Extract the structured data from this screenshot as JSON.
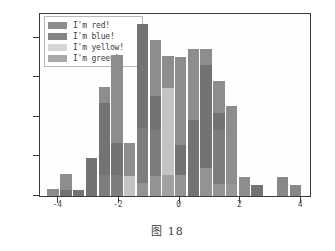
{
  "caption": "图 18",
  "legend": {
    "position": "upper-left",
    "entries": [
      {
        "label": "I'm red!",
        "color": "#8d8d8d"
      },
      {
        "label": "I'm blue!",
        "color": "#6e6e6e"
      },
      {
        "label": "I'm yellow!",
        "color": "#cfcfcf"
      },
      {
        "label": "I'm green!",
        "color": "#9a9a9a"
      }
    ]
  },
  "chart_data": {
    "type": "bar",
    "title": "",
    "xlabel": "",
    "ylabel": "",
    "xlim": [
      -4.6,
      4.3
    ],
    "ylim": [
      0,
      23
    ],
    "grid": false,
    "legend_position": "upper left",
    "xticks": [
      -4,
      -2,
      0,
      2,
      4
    ],
    "yticks": [
      0,
      5,
      10,
      15,
      20
    ],
    "bin_width": 0.42,
    "series": [
      {
        "name": "I'm red!",
        "color": "#8d8d8d",
        "x": [
          -4.15,
          -3.72,
          -3.3,
          -2.88,
          -2.46,
          -2.04,
          -1.62,
          -1.2,
          -0.78,
          -0.36,
          0.06,
          0.48,
          0.9,
          1.32,
          1.74,
          2.16,
          2.58,
          3.0,
          3.42,
          3.84
        ],
        "values": [
          0.9,
          2.8,
          0.8,
          4.8,
          13.8,
          17.8,
          6.7,
          21.7,
          19.7,
          17.7,
          17.6,
          18.6,
          18.6,
          14.5,
          11.4,
          2.4,
          1.4,
          0,
          0,
          0
        ]
      },
      {
        "name": "I'm blue!",
        "color": "#6e6e6e",
        "x": [
          -4.15,
          -3.72,
          -3.3,
          -2.88,
          -2.46,
          -2.04,
          -1.62,
          -1.2,
          -0.78,
          -0.36,
          0.06,
          0.48,
          0.9,
          1.32,
          1.74,
          2.16,
          2.58,
          3.0,
          3.42,
          3.84
        ],
        "values": [
          0,
          0.8,
          0.8,
          4.8,
          11.7,
          6.7,
          0,
          21.7,
          12.7,
          0,
          6.5,
          9.6,
          16.6,
          10.5,
          0,
          0,
          1.4,
          0,
          2.4,
          1.4
        ]
      },
      {
        "name": "I'm yellow!",
        "color": "#cfcfcf",
        "x": [
          -4.15,
          -3.72,
          -3.3,
          -2.88,
          -2.46,
          -2.04,
          -1.62,
          -1.2,
          -0.78,
          -0.36,
          0.06,
          0.48,
          0.9,
          1.32,
          1.74,
          2.16,
          2.58,
          3.0,
          3.42,
          3.84
        ],
        "values": [
          0,
          0,
          0,
          0,
          2.7,
          2.7,
          2.5,
          8.6,
          8.4,
          13.6,
          0,
          0,
          0,
          8.3,
          0,
          0,
          0,
          0,
          0,
          0
        ]
      },
      {
        "name": "I'm green!",
        "color": "#9a9a9a",
        "x": [
          -4.15,
          -3.72,
          -3.3,
          -2.88,
          -2.46,
          -2.04,
          -1.62,
          -1.2,
          -0.78,
          -0.36,
          0.06,
          0.48,
          0.9,
          1.32,
          1.74,
          2.16,
          2.58,
          3.0,
          3.42,
          3.84
        ],
        "values": [
          0,
          0,
          0,
          0,
          0,
          0,
          0,
          1.6,
          2.5,
          2.7,
          2.7,
          0,
          3.5,
          1.5,
          1.5,
          0,
          0,
          0,
          0,
          0
        ]
      }
    ]
  }
}
